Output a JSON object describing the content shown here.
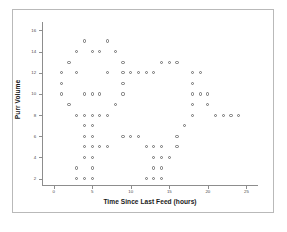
{
  "chart_data": {
    "type": "scatter",
    "title": "",
    "xlabel": "Time Since Last Feed (hours)",
    "ylabel": "Purr Volume",
    "xlim": [
      -1.5,
      26.5
    ],
    "ylim": [
      1.4,
      16.8
    ],
    "xticks": [
      0,
      5,
      10,
      15,
      20,
      25
    ],
    "xtick_labels": [
      "0",
      "5",
      "10",
      "15",
      "20",
      "25"
    ],
    "yticks": [
      2,
      4,
      6,
      8,
      10,
      12,
      14,
      16
    ],
    "ytick_labels": [
      "2",
      "4",
      "6",
      "8",
      "10",
      "12",
      "14",
      "16"
    ],
    "grid": false,
    "legend": null,
    "marker": "open-circle",
    "marker_color": "#6f6f6f",
    "points": [
      {
        "x": 4,
        "y": 15
      },
      {
        "x": 7,
        "y": 15
      },
      {
        "x": 3,
        "y": 14
      },
      {
        "x": 5,
        "y": 14
      },
      {
        "x": 6,
        "y": 14
      },
      {
        "x": 8,
        "y": 14
      },
      {
        "x": 2,
        "y": 13
      },
      {
        "x": 9,
        "y": 13
      },
      {
        "x": 14,
        "y": 13
      },
      {
        "x": 15,
        "y": 13
      },
      {
        "x": 16,
        "y": 13
      },
      {
        "x": 1,
        "y": 12
      },
      {
        "x": 3,
        "y": 12
      },
      {
        "x": 7,
        "y": 12
      },
      {
        "x": 9,
        "y": 12
      },
      {
        "x": 10,
        "y": 12
      },
      {
        "x": 11,
        "y": 12
      },
      {
        "x": 12,
        "y": 12
      },
      {
        "x": 13,
        "y": 12
      },
      {
        "x": 18,
        "y": 12
      },
      {
        "x": 19,
        "y": 12
      },
      {
        "x": 1,
        "y": 11
      },
      {
        "x": 9,
        "y": 11
      },
      {
        "x": 18,
        "y": 11
      },
      {
        "x": 1,
        "y": 10
      },
      {
        "x": 4,
        "y": 10
      },
      {
        "x": 5,
        "y": 10
      },
      {
        "x": 6,
        "y": 10
      },
      {
        "x": 9,
        "y": 10
      },
      {
        "x": 18,
        "y": 10
      },
      {
        "x": 19,
        "y": 10
      },
      {
        "x": 20,
        "y": 10
      },
      {
        "x": 2,
        "y": 9
      },
      {
        "x": 8,
        "y": 9
      },
      {
        "x": 18,
        "y": 9
      },
      {
        "x": 20,
        "y": 9
      },
      {
        "x": 3,
        "y": 8
      },
      {
        "x": 4,
        "y": 8
      },
      {
        "x": 5,
        "y": 8
      },
      {
        "x": 6,
        "y": 8
      },
      {
        "x": 7,
        "y": 8
      },
      {
        "x": 18,
        "y": 8
      },
      {
        "x": 21,
        "y": 8
      },
      {
        "x": 22,
        "y": 8
      },
      {
        "x": 23,
        "y": 8
      },
      {
        "x": 24,
        "y": 8
      },
      {
        "x": 4,
        "y": 7
      },
      {
        "x": 5,
        "y": 7
      },
      {
        "x": 17,
        "y": 7
      },
      {
        "x": 4,
        "y": 6
      },
      {
        "x": 5,
        "y": 6
      },
      {
        "x": 9,
        "y": 6
      },
      {
        "x": 10,
        "y": 6
      },
      {
        "x": 11,
        "y": 6
      },
      {
        "x": 16,
        "y": 6
      },
      {
        "x": 4,
        "y": 5
      },
      {
        "x": 5,
        "y": 5
      },
      {
        "x": 6,
        "y": 5
      },
      {
        "x": 7,
        "y": 5
      },
      {
        "x": 12,
        "y": 5
      },
      {
        "x": 13,
        "y": 5
      },
      {
        "x": 14,
        "y": 5
      },
      {
        "x": 16,
        "y": 5
      },
      {
        "x": 4,
        "y": 4
      },
      {
        "x": 5,
        "y": 4
      },
      {
        "x": 13,
        "y": 4
      },
      {
        "x": 14,
        "y": 4
      },
      {
        "x": 15,
        "y": 4
      },
      {
        "x": 3,
        "y": 3
      },
      {
        "x": 5,
        "y": 3
      },
      {
        "x": 13,
        "y": 3
      },
      {
        "x": 14,
        "y": 3
      },
      {
        "x": 3,
        "y": 2
      },
      {
        "x": 4,
        "y": 2
      },
      {
        "x": 5,
        "y": 2
      },
      {
        "x": 12,
        "y": 2
      },
      {
        "x": 13,
        "y": 2
      },
      {
        "x": 14,
        "y": 2
      }
    ]
  }
}
